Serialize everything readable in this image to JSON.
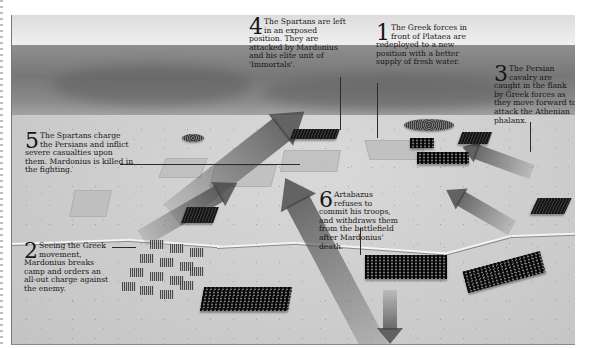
{
  "figure": {
    "style": "grayscale bird's-eye battle illustration"
  },
  "annotations": [
    {
      "number": "1",
      "text": "The Greek forces in front of Plataea are redeployed to a new position with a better supply of fresh water."
    },
    {
      "number": "2",
      "text": "Seeing the Greek movement, Mardonius breaks camp and orders an all-out charge against the enemy."
    },
    {
      "number": "3",
      "text": "The Persian cavalry are caught in the flank by Greek forces as they move forward to attack the Athenian phalanx."
    },
    {
      "number": "4",
      "text": "The Spartans are left in an exposed position. They are attacked by Mardonius and his elite unit of 'Immortals'."
    },
    {
      "number": "5",
      "text": "The Spartans charge the Persians and inflict severe casualties upon them. Mardonius is killed in the fighting."
    },
    {
      "number": "6",
      "text": "Artabazus refuses to commit his troops, and withdraws them from the battlefield after Mardonius' death."
    }
  ],
  "colors": {
    "text": "#161616",
    "sky": "#ececec",
    "hills": "#7a7a7a",
    "plain": "#cfcfcf",
    "troops": "#1e1e1e",
    "arrows": "#464646"
  }
}
